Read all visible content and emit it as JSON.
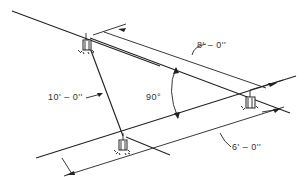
{
  "diagram": {
    "type": "sprinkler-spacing-layout",
    "labels": {
      "dim_top": "8' – 0''",
      "dim_diagonal": "10' – 0''",
      "dim_bottom": "6' – 0''",
      "angle": "90°"
    },
    "nodes": [
      {
        "id": "sprinkler-top-left",
        "x": 86,
        "y": 38
      },
      {
        "id": "sprinkler-bottom",
        "x": 123,
        "y": 136
      },
      {
        "id": "sprinkler-right",
        "x": 250,
        "y": 95
      }
    ],
    "colors": {
      "line": "#222222",
      "text": "#333333",
      "background": "#ffffff"
    }
  }
}
